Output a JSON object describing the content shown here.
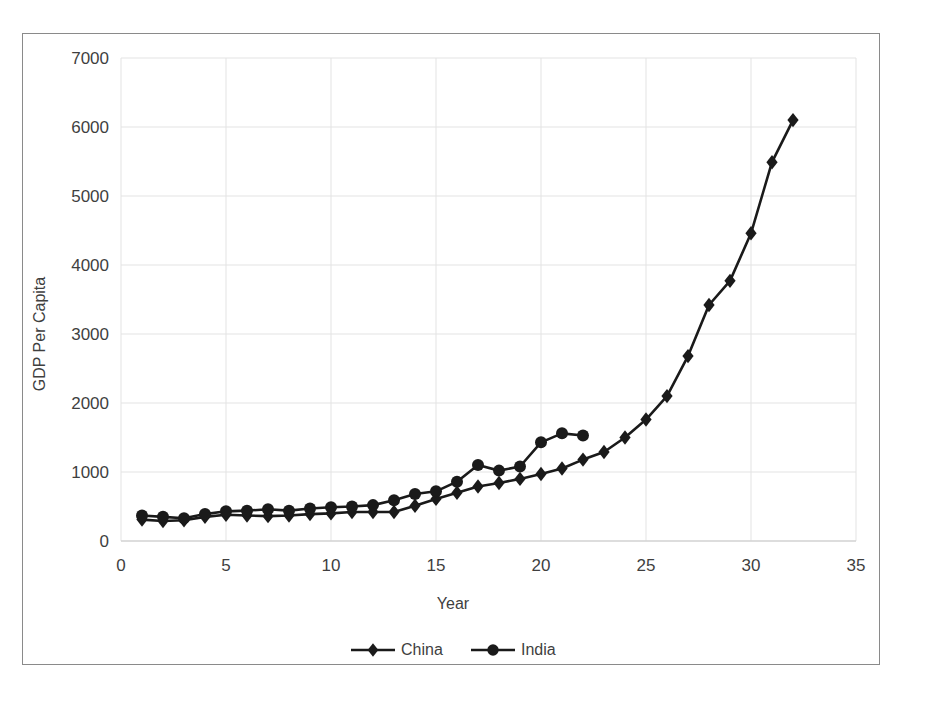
{
  "chart_data": {
    "type": "line",
    "title": "",
    "subtitle": "",
    "xlabel": "Year",
    "ylabel": "GDP Per Capita",
    "xlim": [
      0,
      35
    ],
    "ylim": [
      0,
      7000
    ],
    "xticks": [
      0,
      5,
      10,
      15,
      20,
      25,
      30,
      35
    ],
    "yticks": [
      0,
      1000,
      2000,
      3000,
      4000,
      5000,
      6000,
      7000
    ],
    "xtick_labels": [
      "0",
      "5",
      "10",
      "15",
      "20",
      "25",
      "30",
      "35"
    ],
    "ytick_labels": [
      "0",
      "1000",
      "2000",
      "3000",
      "4000",
      "5000",
      "6000",
      "7000"
    ],
    "grid": true,
    "grid_color": "#e3e3e3",
    "legend_position": "bottom",
    "line_color": "#1a1a1a",
    "series": [
      {
        "name": "China",
        "marker": "diamond",
        "color": "#1a1a1a",
        "x": [
          1,
          2,
          3,
          4,
          5,
          6,
          7,
          8,
          9,
          10,
          11,
          12,
          13,
          14,
          15,
          16,
          17,
          18,
          19,
          20,
          21,
          22,
          23,
          24,
          25,
          26,
          27,
          28,
          29,
          30,
          31,
          32
        ],
        "values": [
          310,
          290,
          300,
          350,
          380,
          370,
          360,
          370,
          390,
          400,
          420,
          420,
          420,
          510,
          610,
          700,
          790,
          840,
          900,
          970,
          1050,
          1180,
          1290,
          1500,
          1760,
          2100,
          2680,
          3420,
          3770,
          4460,
          5490,
          6100
        ]
      },
      {
        "name": "India",
        "marker": "circle",
        "color": "#1a1a1a",
        "x": [
          1,
          2,
          3,
          4,
          5,
          6,
          7,
          8,
          9,
          10,
          11,
          12,
          13,
          14,
          15,
          16,
          17,
          18,
          19,
          20,
          21,
          22
        ],
        "values": [
          370,
          350,
          330,
          390,
          430,
          440,
          460,
          440,
          470,
          490,
          500,
          520,
          590,
          680,
          720,
          860,
          1100,
          1020,
          1080,
          1430,
          1560,
          1530
        ]
      }
    ]
  },
  "legend": {
    "items": [
      {
        "label": "China",
        "marker": "diamond"
      },
      {
        "label": "India",
        "marker": "circle"
      }
    ]
  }
}
